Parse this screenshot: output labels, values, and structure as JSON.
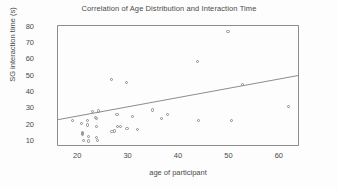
{
  "chart_data": {
    "type": "scatter",
    "title": "Correlation of Age Distribution and Interaction Time",
    "xlabel": "age of participant",
    "ylabel": "SG interaction time (s)",
    "xlim": [
      16,
      64
    ],
    "ylim": [
      7,
      81
    ],
    "xticks": [
      20,
      30,
      40,
      50,
      60
    ],
    "yticks": [
      10,
      20,
      30,
      40,
      50,
      60,
      70,
      80
    ],
    "grid": false,
    "legend": null,
    "marker": "open-circle",
    "marker_color": "#8c8c8c",
    "line_color": "#8c8c8c",
    "points": [
      {
        "x": 19.0,
        "y": 22.8
      },
      {
        "x": 20.8,
        "y": 21.0
      },
      {
        "x": 21.0,
        "y": 15.5
      },
      {
        "x": 21.0,
        "y": 14.6
      },
      {
        "x": 21.0,
        "y": 13.8
      },
      {
        "x": 21.2,
        "y": 10.2
      },
      {
        "x": 22.0,
        "y": 22.6
      },
      {
        "x": 22.0,
        "y": 19.8
      },
      {
        "x": 22.2,
        "y": 12.6
      },
      {
        "x": 22.3,
        "y": 10.0
      },
      {
        "x": 23.0,
        "y": 28.0
      },
      {
        "x": 23.6,
        "y": 24.6
      },
      {
        "x": 23.8,
        "y": 23.6
      },
      {
        "x": 23.8,
        "y": 19.0
      },
      {
        "x": 23.9,
        "y": 12.2
      },
      {
        "x": 24.0,
        "y": 10.4
      },
      {
        "x": 24.2,
        "y": 28.4
      },
      {
        "x": 26.8,
        "y": 47.6
      },
      {
        "x": 26.9,
        "y": 16.0
      },
      {
        "x": 27.4,
        "y": 16.2
      },
      {
        "x": 27.9,
        "y": 26.2
      },
      {
        "x": 28.0,
        "y": 19.0
      },
      {
        "x": 28.6,
        "y": 18.8
      },
      {
        "x": 29.8,
        "y": 46.0
      },
      {
        "x": 29.9,
        "y": 17.8
      },
      {
        "x": 30.9,
        "y": 25.2
      },
      {
        "x": 31.9,
        "y": 17.0
      },
      {
        "x": 35.0,
        "y": 29.0
      },
      {
        "x": 36.8,
        "y": 23.6
      },
      {
        "x": 37.9,
        "y": 26.4
      },
      {
        "x": 43.9,
        "y": 58.6
      },
      {
        "x": 44.0,
        "y": 22.8
      },
      {
        "x": 49.9,
        "y": 77.2
      },
      {
        "x": 50.6,
        "y": 22.6
      },
      {
        "x": 52.8,
        "y": 44.4
      },
      {
        "x": 61.9,
        "y": 31.0
      }
    ],
    "trendline": {
      "x0": 16.0,
      "y0": 23.0,
      "x1": 64.0,
      "y1": 50.2
    }
  }
}
